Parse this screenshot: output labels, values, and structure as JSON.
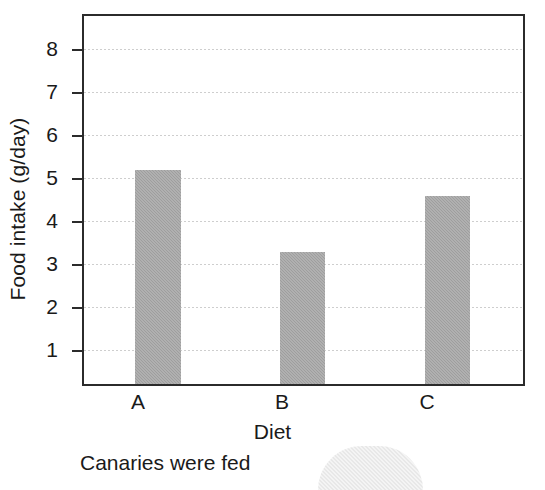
{
  "chart_data": {
    "type": "bar",
    "title": "",
    "xlabel": "Diet",
    "ylabel": "Food intake (g/day)",
    "categories": [
      "A",
      "B",
      "C"
    ],
    "values": [
      6.77,
      4.87,
      6.17
    ],
    "ylim": [
      0,
      8.65
    ],
    "yticks": [
      1,
      2,
      3,
      4,
      5,
      6,
      7,
      8
    ],
    "ytick_labels": [
      "1",
      "2",
      "3",
      "4",
      "5",
      "6",
      "7",
      "8"
    ],
    "grid": "horizontal dotted light-gray",
    "legend": "none",
    "bar_color": "#9e9e9e",
    "frame_color": "#2b2b2b",
    "gridline_color": "#c9c9c9",
    "series": [
      {
        "name": "Food intake",
        "values": [
          6.77,
          4.87,
          6.17
        ]
      }
    ]
  },
  "axis": {
    "y_title": "Food intake (g/day)",
    "x_title": "Diet"
  },
  "caption": {
    "text": "Canaries were fed"
  }
}
